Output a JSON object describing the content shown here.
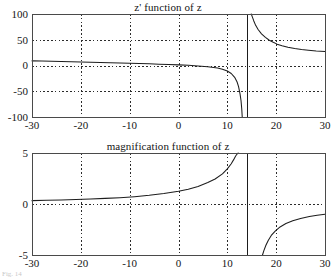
{
  "figure": {
    "background": "#ffffff",
    "foreground": "#1d1d1d",
    "grid_color": "#2b2b2b",
    "caption": "Fig. 14"
  },
  "chart_data": [
    {
      "id": "z-prime",
      "type": "line",
      "title": "z' function of z",
      "xlabel": "",
      "ylabel": "",
      "xlim": [
        -30,
        30
      ],
      "ylim": [
        -100,
        100
      ],
      "grid": true,
      "legend": "none",
      "xticks": [
        -30,
        -20,
        -10,
        0,
        10,
        20,
        30
      ],
      "xticklabels": [
        "-30",
        "-20",
        "-10",
        "0",
        "10",
        "20",
        "30"
      ],
      "yticks": [
        -100,
        -50,
        0,
        50,
        100
      ],
      "yticklabels": [
        "-100",
        "-50",
        "0",
        "50",
        "100"
      ],
      "annotations": [
        {
          "kind": "vertical-asymptote",
          "x": 14.0
        }
      ],
      "series": [
        {
          "name": "z' branch left",
          "x": [
            -30,
            -28,
            -26,
            -24,
            -22,
            -20,
            -18,
            -16,
            -14,
            -12,
            -10,
            -8,
            -6,
            -4,
            -2,
            0,
            2,
            4,
            6,
            8,
            9,
            10,
            10.8,
            11.5,
            12,
            12.3,
            12.6,
            12.8,
            12.95,
            13.05
          ],
          "values": [
            9.0,
            8.6,
            8.1,
            7.7,
            7.2,
            6.8,
            6.3,
            5.8,
            5.3,
            4.8,
            4.3,
            3.8,
            3.2,
            2.6,
            1.9,
            1.2,
            0.3,
            -0.8,
            -2.3,
            -5.0,
            -7.3,
            -10.8,
            -15.5,
            -23.0,
            -32.0,
            -41.0,
            -55.0,
            -68.0,
            -84.0,
            -100.0
          ]
        },
        {
          "name": "z' branch right",
          "x": [
            14.9,
            15.1,
            15.4,
            15.8,
            16.3,
            17.0,
            17.8,
            18.6,
            19.4,
            20.2,
            21.2,
            22.4,
            23.8,
            25.2,
            26.6,
            28.2,
            30.0
          ],
          "values": [
            100.0,
            95.0,
            87.0,
            78.0,
            70.0,
            61.5,
            54.5,
            49.0,
            45.0,
            41.5,
            38.5,
            35.6,
            33.0,
            31.0,
            29.6,
            28.2,
            27.0
          ]
        }
      ]
    },
    {
      "id": "magnification",
      "type": "line",
      "title": "magnification function of z",
      "xlabel": "",
      "ylabel": "",
      "xlim": [
        -30,
        30
      ],
      "ylim": [
        -5,
        5
      ],
      "grid": true,
      "legend": "none",
      "xticks": [
        -30,
        -20,
        -10,
        0,
        10,
        20,
        30
      ],
      "xticklabels": [
        "-30",
        "-20",
        "-10",
        "0",
        "10",
        "20",
        "30"
      ],
      "yticks": [
        -5,
        0,
        5
      ],
      "yticklabels": [
        "-5",
        "0",
        "5"
      ],
      "annotations": [
        {
          "kind": "vertical-asymptote",
          "x": 14.0
        }
      ],
      "series": [
        {
          "name": "magnification branch left",
          "x": [
            -30,
            -27,
            -24,
            -21,
            -18,
            -15,
            -12,
            -9,
            -6,
            -3,
            0,
            2,
            4,
            6,
            7.5,
            9,
            10,
            10.8,
            11.3,
            11.7,
            12.0,
            12.2
          ],
          "values": [
            0.33,
            0.36,
            0.4,
            0.44,
            0.49,
            0.55,
            0.62,
            0.72,
            0.85,
            1.02,
            1.25,
            1.45,
            1.72,
            2.1,
            2.45,
            2.95,
            3.45,
            3.95,
            4.35,
            4.7,
            4.9,
            5.0
          ]
        },
        {
          "name": "magnification branch right",
          "x": [
            17.2,
            17.5,
            17.9,
            18.4,
            19.0,
            19.8,
            20.8,
            22.0,
            23.4,
            25.0,
            26.8,
            28.4,
            30.0
          ],
          "values": [
            -5.0,
            -4.55,
            -4.05,
            -3.55,
            -3.08,
            -2.65,
            -2.25,
            -1.92,
            -1.65,
            -1.42,
            -1.22,
            -1.1,
            -1.0
          ]
        }
      ]
    }
  ]
}
